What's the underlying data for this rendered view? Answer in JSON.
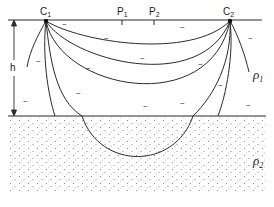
{
  "diagram": {
    "electrodes": [
      {
        "id": "c1",
        "label": "C",
        "sub": "1"
      },
      {
        "id": "c2",
        "label": "C",
        "sub": "2"
      }
    ],
    "potential_electrodes": [
      {
        "id": "p1",
        "label": "P",
        "sub": "1"
      },
      {
        "id": "p2",
        "label": "P",
        "sub": "2"
      }
    ],
    "layers": [
      {
        "id": "upper",
        "resistivity_symbol": "ρ",
        "sub": "1"
      },
      {
        "id": "lower",
        "resistivity_symbol": "ρ",
        "sub": "2"
      }
    ],
    "thickness_label": "h",
    "current_marker": "~",
    "colors": {
      "line": "#2a2a2a",
      "dots": "#777777",
      "background": "#ffffff"
    }
  }
}
